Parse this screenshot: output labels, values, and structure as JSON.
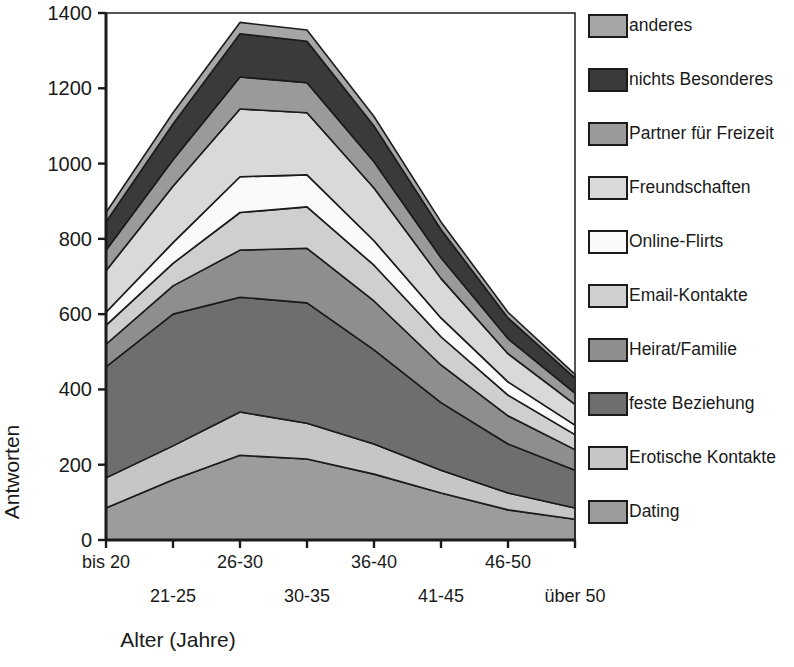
{
  "chart_data": {
    "type": "area",
    "stacked": true,
    "title": "",
    "xlabel": "Alter (Jahre)",
    "ylabel": "Antworten",
    "categories": [
      "bis 20",
      "21-25",
      "26-30",
      "30-35",
      "36-40",
      "41-45",
      "46-50",
      "über 50"
    ],
    "ylim": [
      0,
      1400
    ],
    "ytick_values": [
      0,
      200,
      400,
      600,
      800,
      1000,
      1200,
      1400
    ],
    "ytick_labels": [
      "0",
      "200",
      "400",
      "600",
      "800",
      "1000",
      "1200",
      "1400"
    ],
    "grid": false,
    "legend_position": "right",
    "series": [
      {
        "name": "Dating",
        "color": "#9c9c9c",
        "values": [
          85,
          160,
          225,
          215,
          175,
          125,
          80,
          55
        ]
      },
      {
        "name": "Erotische Kontakte",
        "color": "#c6c6c6",
        "values": [
          80,
          90,
          115,
          95,
          80,
          60,
          45,
          30
        ]
      },
      {
        "name": "feste Beziehung",
        "color": "#6e6e6e",
        "values": [
          295,
          350,
          305,
          320,
          250,
          180,
          130,
          100
        ]
      },
      {
        "name": "Heirat/Familie",
        "color": "#8e8e8e",
        "values": [
          60,
          75,
          125,
          145,
          130,
          100,
          75,
          55
        ]
      },
      {
        "name": "Email-Kontakte",
        "color": "#cfcfcf",
        "values": [
          50,
          60,
          100,
          110,
          95,
          75,
          55,
          40
        ]
      },
      {
        "name": "Online-Flirts",
        "color": "#fafafa",
        "values": [
          35,
          55,
          95,
          85,
          65,
          50,
          35,
          25
        ]
      },
      {
        "name": "Freundschaften",
        "color": "#d9d9d9",
        "values": [
          110,
          150,
          180,
          165,
          140,
          105,
          75,
          55
        ]
      },
      {
        "name": "Partner für Freizeit",
        "color": "#9a9a9a",
        "values": [
          55,
          70,
          85,
          80,
          70,
          55,
          40,
          30
        ]
      },
      {
        "name": "nichts Besonderes",
        "color": "#3a3a3a",
        "values": [
          75,
          95,
          115,
          110,
          95,
          75,
          55,
          40
        ]
      },
      {
        "name": "anderes",
        "color": "#a6a6a6",
        "values": [
          25,
          30,
          30,
          30,
          25,
          20,
          15,
          10
        ]
      }
    ]
  },
  "legend": {
    "items": [
      {
        "label": "anderes",
        "color": "#a6a6a6"
      },
      {
        "label": "nichts Besonderes",
        "color": "#3a3a3a"
      },
      {
        "label": "Partner für Freizeit",
        "color": "#9a9a9a"
      },
      {
        "label": "Freundschaften",
        "color": "#d9d9d9"
      },
      {
        "label": "Online-Flirts",
        "color": "#fafafa"
      },
      {
        "label": "Email-Kontakte",
        "color": "#cfcfcf"
      },
      {
        "label": "Heirat/Familie",
        "color": "#8e8e8e"
      },
      {
        "label": "feste Beziehung",
        "color": "#6e6e6e"
      },
      {
        "label": "Erotische Kontakte",
        "color": "#c6c6c6"
      },
      {
        "label": "Dating",
        "color": "#9c9c9c"
      }
    ]
  },
  "axes": {
    "y_title": "Antworten",
    "x_title": "Alter (Jahre)",
    "axis_color": "#1b1b1b",
    "outline_color": "#2a2a2a"
  }
}
